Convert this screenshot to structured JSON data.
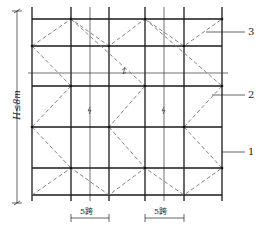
{
  "diagram": {
    "type": "scaffold bracing elevation",
    "height_label": "H≤8m",
    "span_labels": [
      "5跨",
      "5跨"
    ],
    "callouts": [
      {
        "id": "1",
        "label": "1"
      },
      {
        "id": "2",
        "label": "2"
      },
      {
        "id": "3",
        "label": "3"
      }
    ],
    "colors": {
      "frame": "#1a1a1a",
      "bracing": "#777777",
      "background": "#ffffff"
    }
  }
}
